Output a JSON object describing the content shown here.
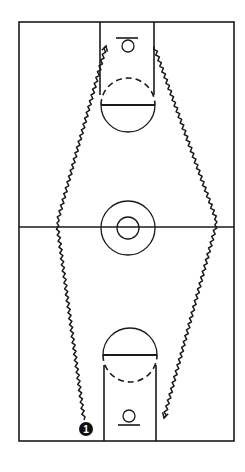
{
  "diagram": {
    "court": {
      "orientation": "vertical",
      "boundary": {
        "left": 19,
        "top": 22,
        "right": 234,
        "bottom": 441
      },
      "half_court_line_y": 227,
      "center_circle": {
        "cx": 128,
        "cy": 228,
        "outer_r": 27,
        "inner_r": 11
      },
      "lane": {
        "left": 100,
        "right": 154,
        "width_px": 54
      },
      "top_key": {
        "free_throw_y": 105,
        "circle_r": 27,
        "basket": {
          "cx": 128,
          "cy": 46,
          "r": 6
        },
        "backboard_y": 38
      },
      "bottom_key": {
        "free_throw_y": 355,
        "circle_r": 27,
        "basket": {
          "cx": 129,
          "cy": 416,
          "r": 6
        },
        "backboard_y": 425
      }
    },
    "players": [
      {
        "label": "1",
        "x": 86,
        "y": 429,
        "style": "filled-black-circle"
      }
    ],
    "paths": [
      {
        "name": "dribble-up-left",
        "type": "dribble-zigzag",
        "points": [
          [
            84,
            420
          ],
          [
            57,
            223
          ],
          [
            106,
            46
          ]
        ],
        "arrow": "end"
      },
      {
        "name": "dribble-down-right",
        "type": "dribble-zigzag",
        "points": [
          [
            154,
            46
          ],
          [
            217,
            222
          ],
          [
            164,
            418
          ]
        ],
        "arrow": "end"
      }
    ],
    "colors": {
      "line": "#1a1a1a",
      "background": "#ffffff",
      "player_fill": "#111111",
      "player_text": "#ffffff"
    }
  }
}
